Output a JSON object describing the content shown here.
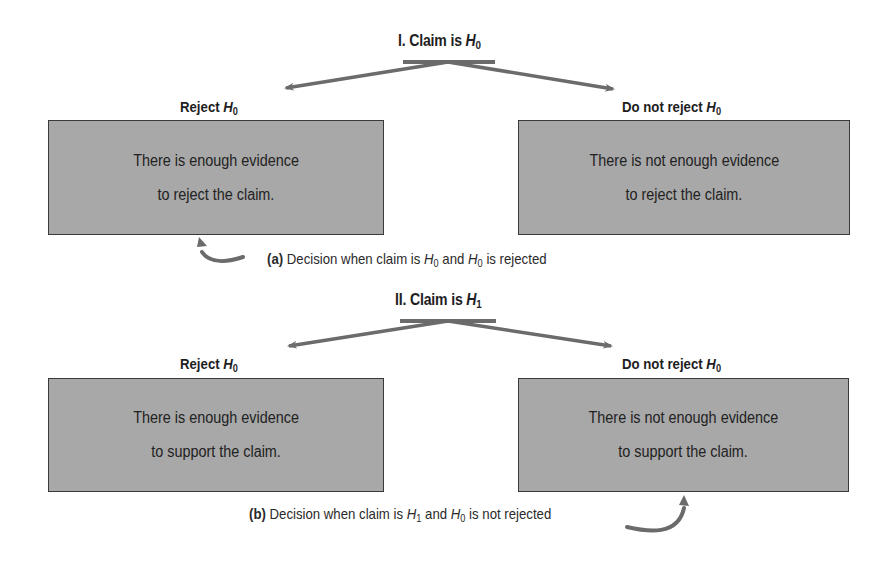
{
  "section_I": {
    "title_prefix": "I. Claim is ",
    "title_var": "H",
    "title_sub": "0",
    "left": {
      "label_prefix": "Reject ",
      "label_var": "H",
      "label_sub": "0",
      "line1": "There is enough evidence",
      "line2": "to reject the claim."
    },
    "right": {
      "label_prefix": "Do not reject ",
      "label_var": "H",
      "label_sub": "0",
      "line1": "There is not enough evidence",
      "line2": "to reject the claim."
    },
    "caption": {
      "tag": "(a)",
      "text1": " Decision when claim is ",
      "var1": "H",
      "sub1": "0",
      "text2": " and ",
      "var2": "H",
      "sub2": "0",
      "text3": " is rejected"
    }
  },
  "section_II": {
    "title_prefix": "II. Claim is ",
    "title_var": "H",
    "title_sub": "1",
    "left": {
      "label_prefix": "Reject ",
      "label_var": "H",
      "label_sub": "0",
      "line1": "There is enough evidence",
      "line2": "to support the claim."
    },
    "right": {
      "label_prefix": "Do not reject ",
      "label_var": "H",
      "label_sub": "0",
      "line1": "There is not enough evidence",
      "line2": "to support the claim."
    },
    "caption": {
      "tag": "(b)",
      "text1": " Decision when claim is ",
      "var1": "H",
      "sub1": "1",
      "text2": " and ",
      "var2": "H",
      "sub2": "0",
      "text3": " is not rejected"
    }
  },
  "colors": {
    "box_fill": "#a8a8a8",
    "box_border": "#3a3a3a",
    "arrow": "#6b6b6b",
    "text": "#1e1e1e"
  }
}
